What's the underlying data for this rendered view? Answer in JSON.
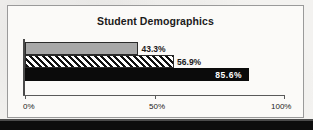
{
  "chart_data": {
    "type": "bar",
    "orientation": "horizontal",
    "title": "Student Demographics",
    "xlabel": "",
    "ylabel": "",
    "xlim": [
      0,
      100
    ],
    "grid": false,
    "legend": "none",
    "categories": [
      "Series 1",
      "Series 2",
      "Series 3"
    ],
    "values": [
      43.3,
      56.9,
      85.6
    ],
    "bars": [
      {
        "value": 43.3,
        "label": "43.3%",
        "fill": "solid-gray",
        "label_position": "outside"
      },
      {
        "value": 56.9,
        "label": "56.9%",
        "fill": "diagonal-hatch",
        "label_position": "outside"
      },
      {
        "value": 85.6,
        "label": "85.6%",
        "fill": "solid-black",
        "label_position": "inside"
      }
    ],
    "xticks": [
      0,
      50,
      100
    ],
    "xticklabels": [
      "0%",
      "50%",
      "100%"
    ]
  },
  "colors": {
    "bar_gray": "#a8a8a8",
    "bar_black": "#0b0b0b",
    "hatch_line": "#111111",
    "frame_border": "#9a9a9a",
    "axis": "#4a4a4a",
    "page_background": "#f3f2f0",
    "plot_background": "#fbfaf8",
    "text": "#1b1b1b",
    "inside_label_text": "#ffffff"
  }
}
